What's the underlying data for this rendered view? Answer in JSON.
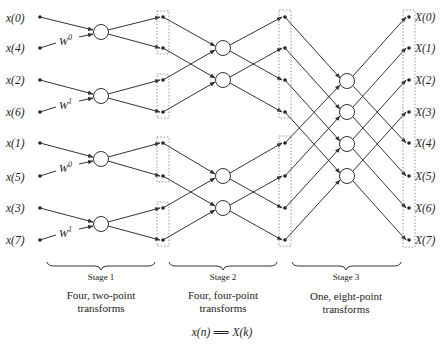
{
  "diagram": {
    "inputs": [
      "x(0)",
      "x(4)",
      "x(2)",
      "x(6)",
      "x(1)",
      "x(5)",
      "x(3)",
      "x(7)"
    ],
    "outputs": [
      "X(0)",
      "X(1)",
      "X(2)",
      "X(3)",
      "X(4)",
      "X(5)",
      "X(6)",
      "X(7)"
    ],
    "twiddles": [
      {
        "base": "W",
        "exp": "0"
      },
      {
        "base": "W",
        "exp": "1"
      },
      {
        "base": "W",
        "exp": "0"
      },
      {
        "base": "W",
        "exp": "1"
      }
    ],
    "stages": [
      {
        "label": "Stage 1",
        "desc_line1": "Four, two-point",
        "desc_line2": "transforms"
      },
      {
        "label": "Stage 2",
        "desc_line1": "Four, four-point",
        "desc_line2": "transforms"
      },
      {
        "label": "Stage 3",
        "desc_line1": "One, eight-point",
        "desc_line2": "transforms"
      }
    ],
    "equation": "x(n) ⟹ X(k)",
    "colors": {
      "line": "#333333",
      "node": "#222222",
      "dotted_box": "#777777",
      "background": "#ffffff"
    }
  }
}
